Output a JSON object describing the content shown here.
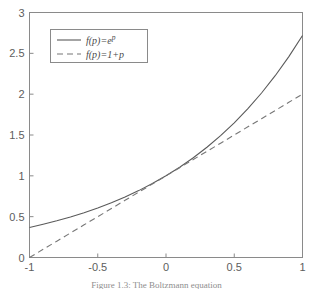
{
  "figure": {
    "caption": "Figure 1.3:  The Boltzmann equation"
  },
  "chart_data": {
    "type": "line",
    "title": "",
    "xlabel": "",
    "ylabel": "",
    "xlim": [
      -1,
      1
    ],
    "ylim": [
      0,
      3
    ],
    "grid": false,
    "legend_position": "upper-left",
    "xticks": [
      "-1",
      "-0.5",
      "0",
      "0.5",
      "1"
    ],
    "xtick_values": [
      -1,
      -0.5,
      0,
      0.5,
      1
    ],
    "yticks": [
      "0",
      "0.5",
      "1",
      "1.5",
      "2",
      "2.5",
      "3"
    ],
    "ytick_values": [
      0,
      0.5,
      1,
      1.5,
      2,
      2.5,
      3
    ],
    "x": [
      -1,
      -0.9,
      -0.8,
      -0.7,
      -0.6,
      -0.5,
      -0.4,
      -0.3,
      -0.2,
      -0.1,
      0,
      0.1,
      0.2,
      0.3,
      0.4,
      0.5,
      0.6,
      0.7,
      0.8,
      0.9,
      1
    ],
    "series": [
      {
        "name": "f(p)=e^p",
        "label_main": "f(p)=e",
        "label_exp": "p",
        "style": "solid",
        "color": "#5a5a5a",
        "values": [
          0.368,
          0.407,
          0.449,
          0.497,
          0.549,
          0.607,
          0.67,
          0.741,
          0.819,
          0.905,
          1.0,
          1.105,
          1.221,
          1.35,
          1.492,
          1.649,
          1.822,
          2.014,
          2.226,
          2.46,
          2.718
        ]
      },
      {
        "name": "f(p)=1+p",
        "label_main": "f(p)=1+p",
        "label_exp": "",
        "style": "dashed",
        "color": "#777777",
        "values": [
          0.0,
          0.1,
          0.2,
          0.3,
          0.4,
          0.5,
          0.6,
          0.7,
          0.8,
          0.9,
          1.0,
          1.1,
          1.2,
          1.3,
          1.4,
          1.5,
          1.6,
          1.7,
          1.8,
          1.9,
          2.0
        ]
      }
    ]
  }
}
